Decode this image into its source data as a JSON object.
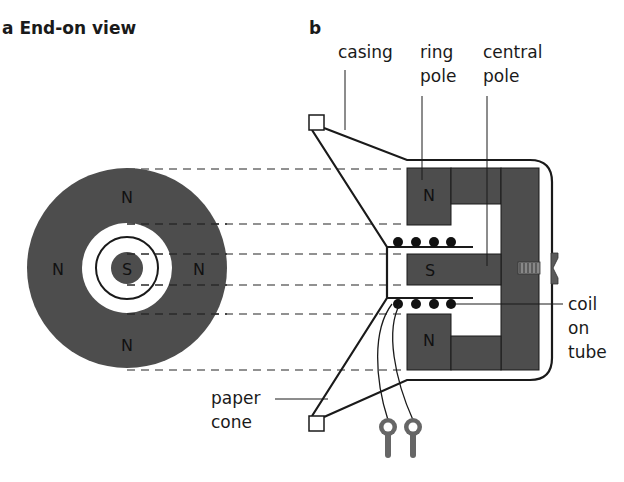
{
  "titles": {
    "a": "a End-on view",
    "b": "b"
  },
  "end_on_view": {
    "poles": {
      "top": "N",
      "left": "N",
      "right": "N",
      "bottom": "N",
      "center": "S"
    }
  },
  "cross_section": {
    "poles": {
      "ring_top": "N",
      "central": "S",
      "ring_bottom": "N"
    }
  },
  "labels": {
    "casing": "casing",
    "ring_pole_1": "ring",
    "ring_pole_2": "pole",
    "central_pole_1": "central",
    "central_pole_2": "pole",
    "coil_1": "coil",
    "coil_2": "on",
    "coil_3": "tube",
    "paper_cone_1": "paper",
    "paper_cone_2": "cone"
  },
  "colors": {
    "magnet_fill": "#4d4d4d",
    "line": "#1a1a1a",
    "dash": "#6e6e6e",
    "terminal": "#666666",
    "background": "#ffffff"
  }
}
